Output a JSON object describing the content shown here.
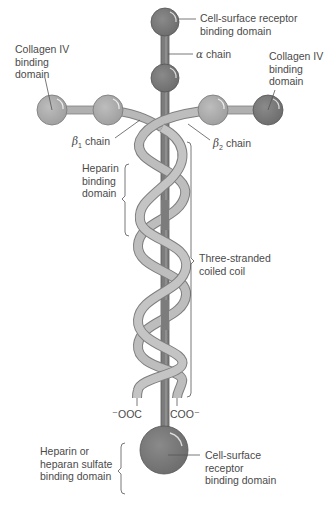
{
  "labels": {
    "top_receptor": [
      "Cell-surface receptor",
      "binding domain"
    ],
    "alpha_chain": {
      "greek": "α",
      "text": " chain"
    },
    "collagen_left": [
      "Collagen IV",
      "binding",
      "domain"
    ],
    "collagen_right": [
      "Collagen IV",
      "binding",
      "domain"
    ],
    "beta1_chain": {
      "greek": "β",
      "sub": "1",
      "text": " chain"
    },
    "beta2_chain": {
      "greek": "β",
      "sub": "2",
      "text": " chain"
    },
    "heparin_binding": [
      "Heparin",
      "binding",
      "domain"
    ],
    "coiled_coil": [
      "Three-stranded",
      "coiled coil"
    ],
    "ooc_left": "⁻OOC",
    "coo_right": "COO⁻",
    "heparan_sulfate": [
      "Heparin or",
      "heparan sulfate",
      "binding domain"
    ],
    "bottom_receptor": [
      "Cell-surface",
      "receptor",
      "binding domain"
    ]
  },
  "colors": {
    "alpha_domain": "#777777",
    "beta_domain": "#a9a9a9",
    "coil_strand": "#b8b8b8",
    "rod": "#8a8a8a",
    "leader_line": "#555555"
  }
}
